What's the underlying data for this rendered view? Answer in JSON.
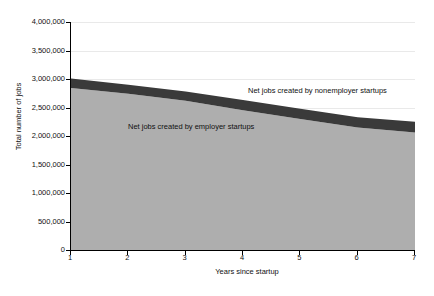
{
  "chart_data": {
    "type": "area",
    "stacked": true,
    "title": "",
    "xlabel": "Years since startup",
    "ylabel": "Total number of jobs",
    "x": [
      1,
      2,
      3,
      4,
      5,
      6,
      7
    ],
    "xlim": [
      1,
      7
    ],
    "ylim": [
      0,
      4000000
    ],
    "grid": true,
    "legend_position": "inline-annotation",
    "xticks": [
      "1",
      "2",
      "3",
      "4",
      "5",
      "6",
      "7"
    ],
    "yticks": [
      "0",
      "500,000",
      "1,000,000",
      "1,500,000",
      "2,000,000",
      "2,500,000",
      "3,000,000",
      "3,500,000",
      "4,000,000"
    ],
    "ytick_values": [
      0,
      500000,
      1000000,
      1500000,
      2000000,
      2500000,
      3000000,
      3500000,
      4000000
    ],
    "series": [
      {
        "name": "Net jobs created by employer startups",
        "color": "#aeaeae",
        "values": [
          2840000,
          2740000,
          2620000,
          2450000,
          2300000,
          2150000,
          2060000
        ]
      },
      {
        "name": "Net jobs created by nonemployer startups",
        "color": "#3a3a3a",
        "values": [
          170000,
          160000,
          160000,
          180000,
          180000,
          180000,
          190000
        ]
      }
    ],
    "cumulative_totals": [
      3010000,
      2900000,
      2780000,
      2630000,
      2480000,
      2330000,
      2250000
    ],
    "annotations": [
      {
        "text": "Net jobs created by nonemployer startups",
        "series": "nonemployer"
      },
      {
        "text": "Net jobs created by employer startups",
        "series": "employer"
      }
    ]
  },
  "colors": {
    "employer_area": "#aeaeae",
    "nonemployer_area": "#3a3a3a",
    "axis": "#000000",
    "grid": "#e9e9e9",
    "background": "#ffffff",
    "text": "#111111"
  }
}
